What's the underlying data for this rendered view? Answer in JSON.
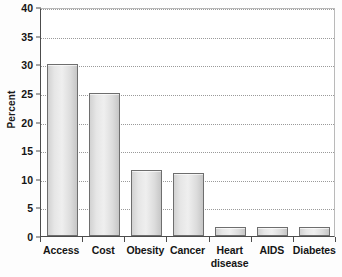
{
  "chart_data": {
    "type": "bar",
    "title": "",
    "subtitle": "",
    "xlabel": "",
    "ylabel": "Percent",
    "categories": [
      "Access",
      "Cost",
      "Obesity",
      "Cancer",
      "Heart disease",
      "AIDS",
      "Diabetes"
    ],
    "category_lines": [
      [
        "Access"
      ],
      [
        "Cost"
      ],
      [
        "Obesity"
      ],
      [
        "Cancer"
      ],
      [
        "Heart",
        "disease"
      ],
      [
        "AIDS"
      ],
      [
        "Diabetes"
      ]
    ],
    "values": [
      30,
      25,
      11.5,
      11,
      1.6,
      1.6,
      1.6
    ],
    "ylim": [
      0,
      40
    ],
    "ytick_step": 5,
    "yticks": [
      0,
      5,
      10,
      15,
      20,
      25,
      30,
      35,
      40
    ],
    "ytick_labels": [
      "0",
      "5",
      "10",
      "15",
      "20",
      "25",
      "30",
      "35",
      "40"
    ],
    "grid": true,
    "grid_axis": "y",
    "grid_style": "dotted",
    "legend": false,
    "legend_position": "none",
    "orientation": "vertical",
    "bar_fill_color": "#e2e2e2",
    "bar_edge_color": "#6e6e6e",
    "axis_color": "#4c4c4c",
    "grid_color": "#9a9a9a",
    "background_color": "#ffffff",
    "text_color": "#151515"
  }
}
